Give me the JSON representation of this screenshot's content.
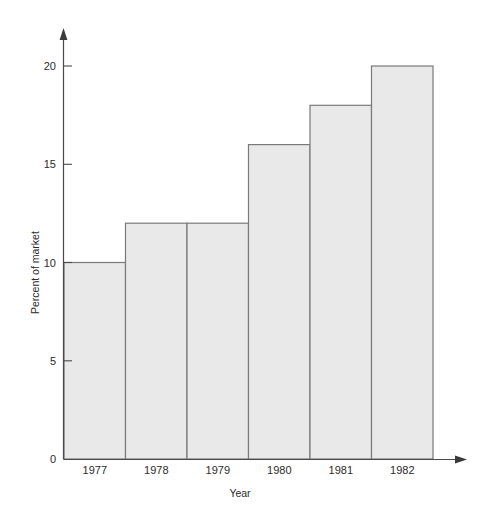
{
  "chart_data": {
    "type": "bar",
    "title": "",
    "subtitle": "",
    "categories": [
      "1977",
      "1978",
      "1979",
      "1980",
      "1981",
      "1982"
    ],
    "values": [
      10,
      12,
      12,
      16,
      18,
      20
    ],
    "xlabel": "Year",
    "ylabel": "Percent of market",
    "ylim": [
      0,
      21.5
    ],
    "y_ticks": [
      0,
      5,
      10,
      15,
      20
    ],
    "y_tick_labels": [
      "0",
      "5",
      "10",
      "15",
      "20"
    ],
    "grid": false,
    "legend": null,
    "annotations": [],
    "series": [
      {
        "name": "Percent of market",
        "values": [
          10,
          12,
          12,
          16,
          18,
          20
        ]
      }
    ],
    "style": {
      "bar_fill": "#e9e9e9",
      "bar_stroke": "#7a7a7a",
      "axis_color": "#4a4a4a",
      "text_color": "#2b2b2b",
      "background": "#ffffff",
      "bars_adjacent": true,
      "axis_arrows": true
    }
  },
  "axes": {
    "y": {
      "label": "Percent of market",
      "ticks": [
        {
          "value": 0,
          "label": "0"
        },
        {
          "value": 5,
          "label": "5"
        },
        {
          "value": 10,
          "label": "10"
        },
        {
          "value": 15,
          "label": "15"
        },
        {
          "value": 20,
          "label": "20"
        }
      ]
    },
    "x": {
      "label": "Year",
      "ticks": [
        {
          "value": "1977",
          "label": "1977"
        },
        {
          "value": "1978",
          "label": "1978"
        },
        {
          "value": "1979",
          "label": "1979"
        },
        {
          "value": "1980",
          "label": "1980"
        },
        {
          "value": "1981",
          "label": "1981"
        },
        {
          "value": "1982",
          "label": "1982"
        }
      ]
    }
  },
  "bars": [
    {
      "category": "1977",
      "value": 10,
      "value_label": "10"
    },
    {
      "category": "1978",
      "value": 12,
      "value_label": "12"
    },
    {
      "category": "1979",
      "value": 12,
      "value_label": "12"
    },
    {
      "category": "1980",
      "value": 16,
      "value_label": "16"
    },
    {
      "category": "1981",
      "value": 18,
      "value_label": "18"
    },
    {
      "category": "1982",
      "value": 20,
      "value_label": "20"
    }
  ]
}
